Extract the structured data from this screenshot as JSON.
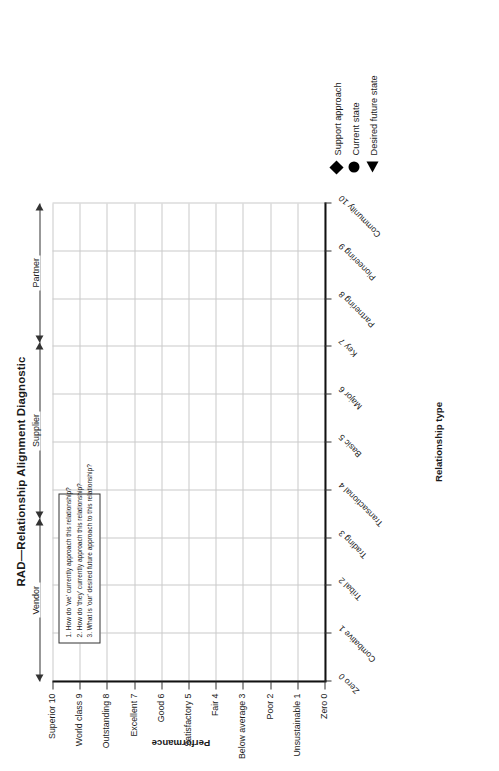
{
  "title": "RAD—Relationship Alignment Diagnostic",
  "segments": [
    {
      "label": "Vendor"
    },
    {
      "label": "Supplier"
    },
    {
      "label": "Partner"
    }
  ],
  "question_box": {
    "questions": [
      "1. How do 'we' currently approach this relationship?",
      "2. How do 'they' currently approach this relationship?",
      "3. What is 'our' desired future approach to this relationship?"
    ]
  },
  "legend": {
    "items": [
      {
        "marker": "diamond-marker",
        "label": "Support approach"
      },
      {
        "marker": "circle-marker",
        "label": "Current state"
      },
      {
        "marker": "triangle-marker",
        "label": "Desired future state"
      }
    ]
  },
  "chart_data": {
    "type": "scatter",
    "title": "RAD—Relationship Alignment Diagnostic",
    "xlabel": "Relationship type",
    "ylabel": "Performance",
    "grid": true,
    "legend_position": "bottom-right",
    "xlim": [
      0,
      10
    ],
    "ylim": [
      0,
      10
    ],
    "x_tick_labels": [
      "Zero 0",
      "Combative 1",
      "Tribal 2",
      "Trading 3",
      "Transactional 4",
      "Basic 5",
      "Major 6",
      "Key 7",
      "Partnering 8",
      "Pioneering 9",
      "Community 10"
    ],
    "x_tick_values": [
      0,
      1,
      2,
      3,
      4,
      5,
      6,
      7,
      8,
      9,
      10
    ],
    "y_tick_labels": [
      "Superior 10",
      "World class 9",
      "Outstanding 8",
      "Excellent 7",
      "Good 6",
      "Satisfactory 5",
      "Fair 4",
      "Below average 3",
      "Poor 2",
      "Unsustainable 1",
      "Zero 0"
    ],
    "y_tick_values": [
      10,
      9,
      8,
      7,
      6,
      5,
      4,
      3,
      2,
      1,
      0
    ],
    "series": [
      {
        "name": "Support approach",
        "marker": "diamond",
        "points": []
      },
      {
        "name": "Current state",
        "marker": "circle",
        "points": []
      },
      {
        "name": "Desired future state",
        "marker": "triangle",
        "points": []
      }
    ],
    "annotations": [
      {
        "text": "Vendor",
        "type": "range-arrow",
        "x_range": [
          0,
          3.4
        ]
      },
      {
        "text": "Supplier",
        "type": "range-arrow",
        "x_range": [
          3.4,
          7.1
        ]
      },
      {
        "text": "Partner",
        "type": "range-arrow",
        "x_range": [
          7.1,
          10
        ]
      }
    ],
    "colors": {
      "axis": "#111111",
      "grid": "#c9c9c9",
      "marker": "#000000"
    }
  }
}
